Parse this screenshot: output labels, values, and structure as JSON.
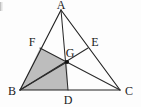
{
  "figure": {
    "background_color": "#fdfdfd",
    "line_color": "#222222",
    "shade_color": "#bdbdbd",
    "label_color": "#1a1a1a"
  },
  "labels": {
    "a": "A",
    "b": "B",
    "c": "C",
    "d": "D",
    "e": "E",
    "f": "F",
    "g": "G"
  },
  "points": {
    "A": {
      "x": 61,
      "y": 10
    },
    "B": {
      "x": 20,
      "y": 90
    },
    "C": {
      "x": 120,
      "y": 90
    },
    "D": {
      "x": 68,
      "y": 90
    },
    "E": {
      "x": 88,
      "y": 48
    },
    "F": {
      "x": 40,
      "y": 48
    },
    "G": {
      "x": 67,
      "y": 62
    }
  },
  "label_positions": {
    "A": {
      "x": 61,
      "y": 9
    },
    "B": {
      "x": 12,
      "y": 95
    },
    "C": {
      "x": 129,
      "y": 95
    },
    "D": {
      "x": 68,
      "y": 104
    },
    "E": {
      "x": 95,
      "y": 46
    },
    "F": {
      "x": 32,
      "y": 46
    },
    "G": {
      "x": 70,
      "y": 57
    }
  },
  "segments": [
    {
      "name": "side-ab",
      "from": "A",
      "to": "B"
    },
    {
      "name": "side-bc",
      "from": "B",
      "to": "C"
    },
    {
      "name": "side-ca",
      "from": "C",
      "to": "A"
    },
    {
      "name": "median-ad",
      "from": "A",
      "to": "D"
    },
    {
      "name": "median-be",
      "from": "B",
      "to": "E"
    },
    {
      "name": "median-cf",
      "from": "C",
      "to": "F"
    }
  ],
  "shaded_polygon": {
    "name": "quadrilateral-bdgf",
    "vertices": [
      "B",
      "D",
      "G",
      "F"
    ],
    "fill": "#bdbdbd"
  },
  "diagonal": {
    "name": "diagonal-bg",
    "from": "B",
    "to": "G"
  },
  "centroid": {
    "name": "G",
    "radius": 2.1
  }
}
